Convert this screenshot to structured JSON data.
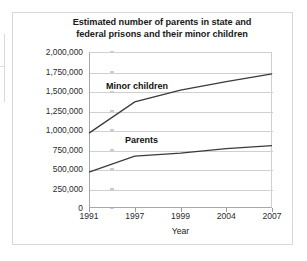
{
  "chart_data": {
    "type": "line",
    "title": "Estimated number of parents in state and federal prisons and their minor children",
    "title_line1": "Estimated number of parents in state and",
    "title_line2": "federal prisons and their minor children",
    "xlabel": "Year",
    "ylabel": "Number",
    "categories": [
      "1991",
      "1997",
      "1999",
      "2004",
      "2007"
    ],
    "ylim": [
      0,
      2000000
    ],
    "ytick_labels": [
      "2,000,000",
      "1,750,000",
      "1,500,000",
      "1,250,000",
      "1,000,000",
      "750,000",
      "500,000",
      "250,000",
      "0"
    ],
    "ytick_values": [
      2000000,
      1750000,
      1500000,
      1250000,
      1000000,
      750000,
      500000,
      250000,
      0
    ],
    "grid": true,
    "legend_position": "inline-labels",
    "series": [
      {
        "name": "Minor children",
        "label": "Minor children",
        "color": "#3a3a3a",
        "values": [
          960000,
          1360000,
          1510000,
          1620000,
          1720000
        ]
      },
      {
        "name": "Parents",
        "label": "Parents",
        "color": "#3a3a3a",
        "values": [
          460000,
          665000,
          705000,
          760000,
          800000
        ]
      }
    ],
    "annotations": [
      {
        "text": "Minor children",
        "x": "1991-1997",
        "y": 1550000
      },
      {
        "text": "Parents",
        "x": "1997",
        "y": 880000
      }
    ]
  },
  "colors": {
    "background": "#ffffff",
    "frame": "#d7d7d7",
    "gridline": "#d0d0d0",
    "axis": "#a8a8a8",
    "line": "#3a3a3a",
    "text": "#1a1a1a"
  }
}
